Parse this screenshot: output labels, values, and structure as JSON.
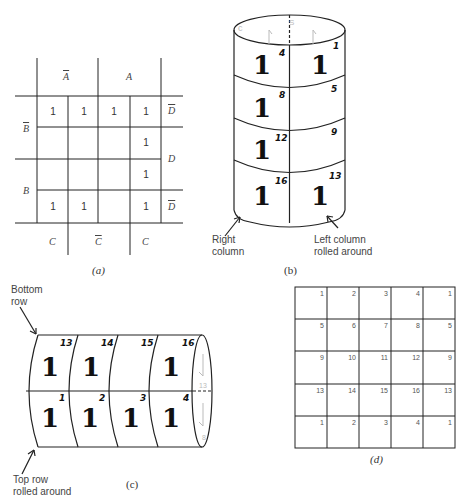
{
  "panel_a": {
    "caption": "(a)",
    "column_headers_top": [
      "A",
      "A"
    ],
    "column_headers_top_overline": [
      true,
      false
    ],
    "column_headers_bottom": [
      "C",
      "C",
      "C"
    ],
    "column_headers_bottom_overline": [
      false,
      true,
      false
    ],
    "row_headers_left": [
      "B",
      "B"
    ],
    "row_headers_left_overline": [
      true,
      false
    ],
    "row_headers_right": [
      "D",
      "D",
      "D"
    ],
    "row_headers_right_overline": [
      true,
      false,
      true
    ],
    "grid": [
      [
        "1",
        "1",
        "1",
        "1"
      ],
      [
        "",
        "",
        "",
        "1"
      ],
      [
        "",
        "",
        "",
        "1"
      ],
      [
        "1",
        "1",
        "",
        "1"
      ]
    ]
  },
  "panel_b": {
    "caption": "(b)",
    "cells": [
      {
        "left_one": "1",
        "left_num": "4",
        "right_one": "1",
        "right_num": "1"
      },
      {
        "left_one": "1",
        "left_num": "8",
        "right_one": "",
        "right_num": "5"
      },
      {
        "left_one": "1",
        "left_num": "12",
        "right_one": "",
        "right_num": "9"
      },
      {
        "left_one": "1",
        "left_num": "16",
        "right_one": "1",
        "right_num": "13"
      }
    ],
    "label_left": "Right\ncolumn",
    "label_left_lines": [
      "Right",
      "column"
    ],
    "label_right_lines": [
      "Left column",
      "rolled around"
    ],
    "top_faint_labels": [
      "c",
      "S"
    ]
  },
  "panel_c": {
    "caption": "(c)",
    "label_top_lines": [
      "Bottom",
      "row"
    ],
    "label_bottom_lines": [
      "Top row",
      "rolled around"
    ],
    "top_row": [
      {
        "one": "1",
        "num": "13"
      },
      {
        "one": "1",
        "num": "14"
      },
      {
        "one": "",
        "num": "15"
      },
      {
        "one": "1",
        "num": "16"
      }
    ],
    "bottom_row": [
      {
        "one": "1",
        "num": "1"
      },
      {
        "one": "1",
        "num": "2"
      },
      {
        "one": "1",
        "num": "3"
      },
      {
        "one": "1",
        "num": "4"
      }
    ],
    "end_faint_labels": [
      "13",
      "8"
    ]
  },
  "panel_d": {
    "caption": "(d)",
    "grid": [
      [
        "1",
        "2",
        "3",
        "4",
        "1"
      ],
      [
        "5",
        "6",
        "7",
        "8",
        "5"
      ],
      [
        "9",
        "10",
        "11",
        "12",
        "9"
      ],
      [
        "13",
        "14",
        "15",
        "16",
        "13"
      ],
      [
        "1",
        "2",
        "3",
        "4",
        "1"
      ]
    ]
  }
}
